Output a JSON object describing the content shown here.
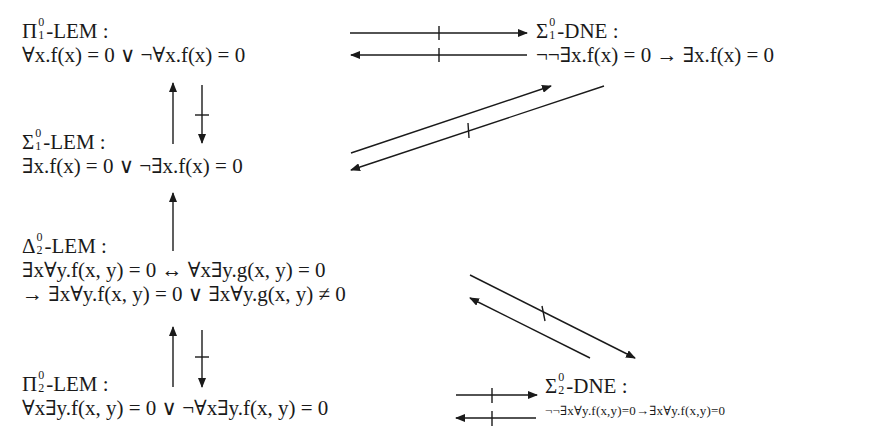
{
  "diagram": {
    "nodes": [
      {
        "id": "pi01-lem",
        "symbol": "Π",
        "sup": "0",
        "sub": "1",
        "name": "-LEM :",
        "formula": "∀x.f(x) = 0 ∨ ¬∀x.f(x) = 0"
      },
      {
        "id": "sigma01-dne",
        "symbol": "Σ",
        "sup": "0",
        "sub": "1",
        "name": "-DNE :",
        "formula": "¬¬∃x.f(x) = 0 → ∃x.f(x) = 0"
      },
      {
        "id": "sigma01-lem",
        "symbol": "Σ",
        "sup": "0",
        "sub": "1",
        "name": "-LEM :",
        "formula": "∃x.f(x) = 0 ∨ ¬∃x.f(x) = 0"
      },
      {
        "id": "delta02-lem",
        "symbol": "Δ",
        "sup": "0",
        "sub": "2",
        "name": "-LEM :",
        "formula": "∃x∀y.f(x, y) = 0 ↔ ∀x∃y.g(x, y) = 0",
        "formula_line2": "→ ∃x∀y.f(x, y) = 0 ∨ ∃x∀y.g(x, y) ≠ 0"
      },
      {
        "id": "pi02-lem",
        "symbol": "Π",
        "sup": "0",
        "sub": "2",
        "name": "-LEM :",
        "formula": "∀x∃y.f(x, y) = 0 ∨ ¬∀x∃y.f(x, y) = 0"
      },
      {
        "id": "sigma02-dne",
        "symbol": "Σ",
        "sup": "0",
        "sub": "2",
        "name": "-DNE :",
        "formula": "¬¬∃x∀y.f(x,y)=0→∃x∀y.f(x,y)=0"
      }
    ],
    "edges": [
      {
        "from": "pi01-lem",
        "to": "sigma01-dne",
        "negated": true
      },
      {
        "from": "sigma01-dne",
        "to": "pi01-lem",
        "negated": true
      },
      {
        "from": "sigma01-lem",
        "to": "pi01-lem",
        "negated": false
      },
      {
        "from": "pi01-lem",
        "to": "sigma01-lem",
        "negated": true
      },
      {
        "from": "sigma01-lem",
        "to": "sigma01-dne",
        "negated": false
      },
      {
        "from": "sigma01-dne",
        "to": "sigma01-lem",
        "negated": true
      },
      {
        "from": "delta02-lem",
        "to": "sigma01-lem",
        "negated": false
      },
      {
        "from": "delta02-lem",
        "to": "sigma02-dne",
        "negated": true
      },
      {
        "from": "sigma02-dne",
        "to": "delta02-lem",
        "negated": false
      },
      {
        "from": "pi02-lem",
        "to": "delta02-lem",
        "negated": false
      },
      {
        "from": "delta02-lem",
        "to": "pi02-lem",
        "negated": true
      },
      {
        "from": "pi02-lem",
        "to": "sigma02-dne",
        "negated": true
      },
      {
        "from": "sigma02-dne",
        "to": "pi02-lem",
        "negated": true
      }
    ],
    "colors": {
      "ink": "#1a1a1a",
      "background": "#ffffff"
    }
  }
}
